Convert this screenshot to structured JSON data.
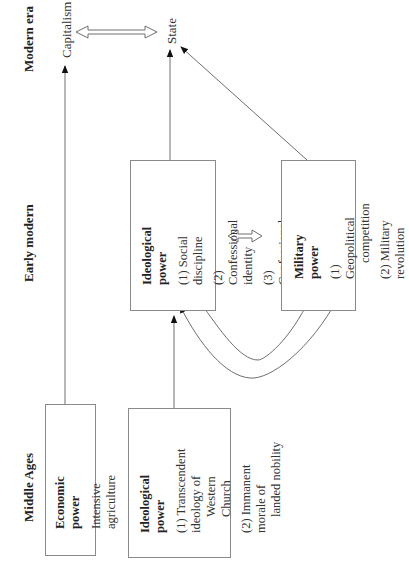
{
  "eras": {
    "modern": "Modern era",
    "early_modern": "Early modern",
    "middle_ages": "Middle Ages"
  },
  "outcomes": {
    "capitalism": "Capitalism",
    "state": "State"
  },
  "boxes": {
    "economic": {
      "title": "Economic power",
      "items": [
        "Intensive agriculture"
      ]
    },
    "ideological_ma": {
      "title": "Ideological power",
      "items": [
        {
          "line1": "(1) Transcendent ideology of",
          "line2": "Western Church"
        },
        {
          "line1": "(2) Immanent morale of",
          "line2": "landed nobility"
        }
      ]
    },
    "ideological_em": {
      "title": "Ideological power",
      "items": [
        "(1) Social discipline",
        "(2) Confessional identity",
        "(3) Confessional conflict"
      ]
    },
    "military": {
      "title": "Military power",
      "items": [
        {
          "line1": "(1) Geopolitical",
          "line2": "competition"
        },
        {
          "line1": "(2) Military revolution",
          "line2": ""
        }
      ]
    }
  },
  "colors": {
    "line": "#6e6e6e",
    "box_border": "#8a8a8a",
    "text": "#222222"
  }
}
